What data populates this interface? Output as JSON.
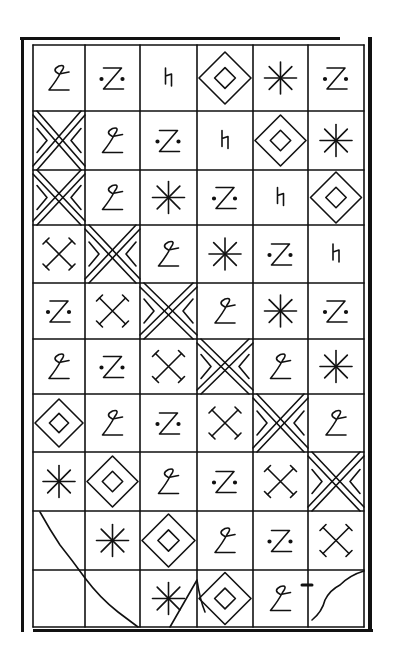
{
  "figure": {
    "columns": 6,
    "rows": 10,
    "col_edges": [
      33,
      85,
      140,
      197,
      253,
      308,
      364
    ],
    "row_edges": [
      45,
      111,
      170,
      225,
      283,
      339,
      394,
      452,
      511,
      570,
      627
    ],
    "stroke_color": "#111111",
    "background": "#ffffff"
  },
  "legend": {
    "loop": "loop-z glyph (cursive ℓ / ƺ)",
    "zdot": "Z with two dots",
    "hook": "h-like hook glyph",
    "diamond": "nested diamond",
    "star": "eight-spoke asterisk",
    "xdouble": "double-line X with chevrons",
    "xcross": "X with serif ends",
    "blank": "empty / curve-only cell"
  },
  "grid": [
    [
      "loop",
      "zdot",
      "hook",
      "diamond",
      "star",
      "zdot"
    ],
    [
      "xdouble",
      "loop",
      "zdot",
      "hook",
      "diamond",
      "star"
    ],
    [
      "xdouble",
      "loop",
      "star",
      "zdot",
      "hook",
      "diamond"
    ],
    [
      "xcross",
      "xdouble",
      "loop",
      "star",
      "zdot",
      "hook"
    ],
    [
      "zdot",
      "xcross",
      "xdouble",
      "loop",
      "star",
      "zdot"
    ],
    [
      "loop",
      "zdot",
      "xcross",
      "xdouble",
      "loop",
      "star"
    ],
    [
      "diamond",
      "loop",
      "zdot",
      "xcross",
      "xdouble",
      "loop"
    ],
    [
      "star",
      "diamond",
      "loop",
      "zdot",
      "xcross",
      "xdouble"
    ],
    [
      "blank",
      "star",
      "diamond",
      "loop",
      "zdot",
      "xcross"
    ],
    [
      "blank",
      "blank",
      "star",
      "diamond",
      "loop",
      "blank"
    ]
  ]
}
